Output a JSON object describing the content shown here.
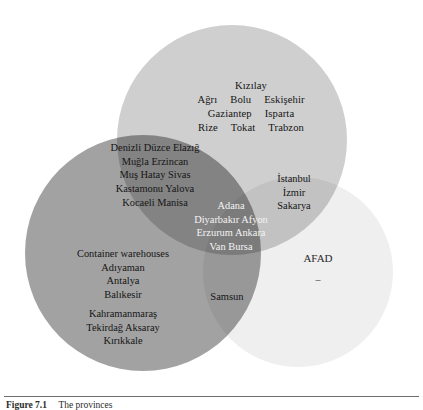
{
  "figure": {
    "type": "venn-diagram",
    "sets": [
      {
        "id": "top",
        "name": "top-circle",
        "color": "#cfcfcf"
      },
      {
        "id": "left",
        "name": "left-circle",
        "color": "#a2a2a2"
      },
      {
        "id": "right",
        "name": "right-circle",
        "color": "#efefef"
      }
    ],
    "regions": {
      "top_only": {
        "line1": "Kızılay",
        "line2_a": "Ağrı",
        "line2_b": "Bolu",
        "line2_c": "Eskişehir",
        "line3_a": "Gaziantep",
        "line3_b": "Isparta",
        "line4_a": "Rize",
        "line4_b": "Tokat",
        "line4_c": "Trabzon"
      },
      "top_left": {
        "line1": "Denizli Düzce Elazığ",
        "line2": "Muğla Erzincan",
        "line3": "Muş Hatay Sivas",
        "line4": "Kastamonu Yalova",
        "line5": "Kocaeli Manisa"
      },
      "top_right": {
        "line1": "İstanbul",
        "line2": "İzmir",
        "line3": "Sakarya"
      },
      "center_all": {
        "line1": "Adana",
        "line2": "Diyarbakır Afyon",
        "line3": "Erzurum Ankara",
        "line4": "Van Bursa"
      },
      "left_only": {
        "line1": "Container warehouses",
        "line2": "Adıyaman",
        "line3": "Antalya",
        "line4": "Balıkesir",
        "line5": "Kahramanmaraş",
        "line6": "Tekirdağ Aksaray",
        "line7": "Kırıkkale"
      },
      "left_right": {
        "line1": "Samsun"
      },
      "right_only": {
        "line1": "AFAD",
        "line2": "–"
      }
    }
  },
  "caption": {
    "number": "Figure 7.1",
    "text": "The provinces"
  }
}
